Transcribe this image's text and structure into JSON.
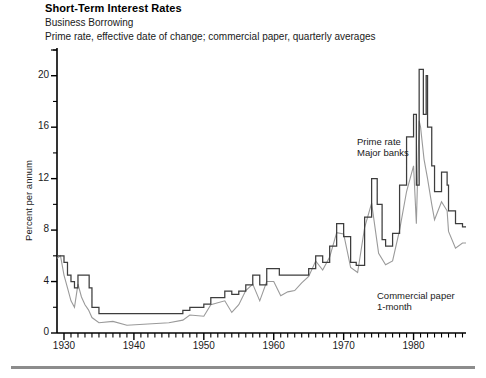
{
  "header": {
    "title": "Short-Term Interest Rates",
    "subtitle": "Business Borrowing",
    "caption": "Prime rate, effective date of change; commercial paper, quarterly averages"
  },
  "annotations": {
    "prime_line1": "Prime rate",
    "prime_line2": "Major banks",
    "cp_line1": "Commercial paper",
    "cp_line2": "1-month"
  },
  "axis": {
    "ylabel": "Percent per annum",
    "yticks": [
      "0",
      "4",
      "8",
      "12",
      "16",
      "20"
    ],
    "xticks": [
      "1930",
      "1940",
      "1950",
      "1960",
      "1970",
      "1980"
    ]
  },
  "chart_data": {
    "type": "line",
    "title": "Short-Term Interest Rates",
    "subtitle": "Business Borrowing",
    "annotation": "Prime rate, effective date of change; commercial paper, quarterly averages",
    "xlabel": "",
    "ylabel": "Percent per annum",
    "xlim": [
      1929,
      1987.5
    ],
    "ylim": [
      0,
      22
    ],
    "ytick_values": [
      0,
      4,
      8,
      12,
      16,
      20
    ],
    "ytick_minor_step": 2,
    "xtick_values": [
      1930,
      1940,
      1950,
      1960,
      1970,
      1980
    ],
    "xtick_minor_step": 1,
    "grid": false,
    "legend": "inline-annotations",
    "colors": {
      "prime": "#3d3d3d",
      "commercial_paper": "#9a9a9a",
      "axis": "#000000",
      "footrule": "#8c8c8c"
    },
    "series": [
      {
        "name": "Prime rate (Major banks)",
        "style": "step",
        "color": "#3d3d3d",
        "x": [
          1929.0,
          1929.6,
          1930.0,
          1930.5,
          1931.0,
          1931.5,
          1932.0,
          1933.0,
          1933.6,
          1934.0,
          1935.0,
          1937.0,
          1939.0,
          1947.0,
          1948.0,
          1950.0,
          1951.0,
          1953.0,
          1954.0,
          1955.0,
          1956.0,
          1957.0,
          1958.0,
          1959.0,
          1960.0,
          1960.8,
          1965.0,
          1966.0,
          1967.0,
          1968.0,
          1969.0,
          1970.0,
          1971.0,
          1971.8,
          1973.0,
          1974.0,
          1974.8,
          1975.5,
          1976.0,
          1977.0,
          1978.0,
          1979.0,
          1980.0,
          1980.4,
          1980.8,
          1981.0,
          1981.4,
          1981.8,
          1982.0,
          1982.6,
          1983.0,
          1984.0,
          1984.8,
          1985.0,
          1986.0,
          1987.0,
          1987.5
        ],
        "y": [
          6.0,
          6.0,
          5.5,
          4.5,
          4.0,
          3.5,
          4.5,
          4.5,
          3.5,
          2.0,
          1.5,
          1.5,
          1.5,
          1.75,
          2.0,
          2.25,
          2.75,
          3.25,
          3.0,
          3.25,
          3.75,
          4.5,
          3.75,
          5.0,
          5.0,
          4.5,
          5.0,
          6.0,
          5.5,
          6.75,
          8.5,
          7.5,
          5.5,
          5.25,
          9.0,
          12.0,
          10.0,
          7.25,
          6.75,
          7.75,
          11.5,
          15.25,
          17.0,
          11.5,
          20.5,
          20.5,
          17.0,
          20.0,
          16.0,
          13.0,
          11.0,
          12.5,
          11.5,
          9.5,
          8.5,
          8.25,
          8.25
        ]
      },
      {
        "name": "Commercial paper (1-month)",
        "style": "line",
        "color": "#9a9a9a",
        "x": [
          1929.0,
          1929.5,
          1930.0,
          1930.5,
          1931.0,
          1931.5,
          1932.0,
          1932.5,
          1933.0,
          1933.5,
          1934.0,
          1935.0,
          1937.0,
          1939.0,
          1942.0,
          1945.0,
          1947.0,
          1948.0,
          1950.0,
          1951.0,
          1953.0,
          1954.0,
          1955.0,
          1956.0,
          1957.0,
          1958.0,
          1959.0,
          1960.0,
          1961.0,
          1962.0,
          1963.0,
          1964.0,
          1965.0,
          1966.0,
          1967.0,
          1968.0,
          1969.0,
          1970.0,
          1971.0,
          1972.0,
          1973.0,
          1974.0,
          1975.0,
          1976.0,
          1977.0,
          1978.0,
          1979.0,
          1980.0,
          1980.4,
          1980.8,
          1981.0,
          1981.5,
          1982.0,
          1982.6,
          1983.0,
          1984.0,
          1984.8,
          1985.0,
          1986.0,
          1987.0,
          1987.5
        ],
        "y": [
          5.8,
          6.0,
          4.5,
          3.5,
          2.5,
          2.0,
          3.8,
          2.8,
          2.2,
          1.8,
          1.2,
          0.8,
          0.9,
          0.6,
          0.7,
          0.8,
          1.0,
          1.4,
          1.3,
          2.2,
          2.5,
          1.6,
          2.2,
          3.3,
          3.8,
          2.5,
          4.0,
          4.0,
          2.9,
          3.2,
          3.3,
          3.9,
          4.4,
          5.6,
          4.9,
          5.9,
          7.8,
          7.7,
          5.1,
          4.7,
          8.2,
          10.1,
          6.2,
          5.3,
          5.6,
          8.0,
          11.0,
          13.0,
          8.5,
          16.5,
          16.0,
          13.5,
          12.0,
          10.0,
          8.8,
          10.2,
          9.5,
          7.9,
          6.6,
          7.0,
          7.0
        ]
      }
    ]
  }
}
